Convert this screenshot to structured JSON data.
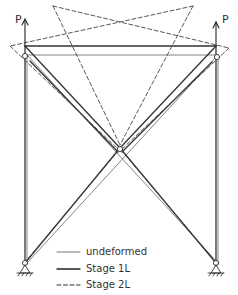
{
  "diagram": {
    "type": "structural frame buckling / deformation stages",
    "load_labels": {
      "left": "P",
      "right": "P"
    },
    "legend": [
      {
        "style": "thin-solid",
        "label": "undeformed"
      },
      {
        "style": "thick-solid",
        "label": "Stage 1L"
      },
      {
        "style": "dashed",
        "label": "Stage 2L"
      }
    ],
    "colors": {
      "line": "#3a3a3a",
      "background": "#ffffff"
    }
  }
}
